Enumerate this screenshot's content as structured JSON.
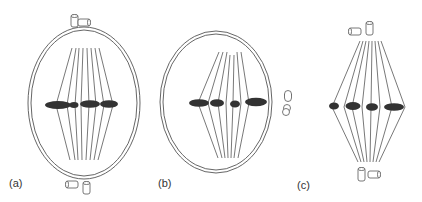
{
  "figure": {
    "colors": {
      "line": "#555555",
      "chromosome": "#333333",
      "label": "#333333"
    }
  },
  "panels": [
    {
      "id": "a",
      "label": "(a)",
      "has_nuclear_envelope": true,
      "centriole_positions": [
        "top",
        "bottom"
      ],
      "chromosome_count": 4
    },
    {
      "id": "b",
      "label": "(b)",
      "has_nuclear_envelope": true,
      "centriole_positions": [
        "right-side"
      ],
      "chromosome_count": 4
    },
    {
      "id": "c",
      "label": "(c)",
      "has_nuclear_envelope": false,
      "centriole_positions": [
        "top",
        "bottom"
      ],
      "chromosome_count": 4
    }
  ]
}
